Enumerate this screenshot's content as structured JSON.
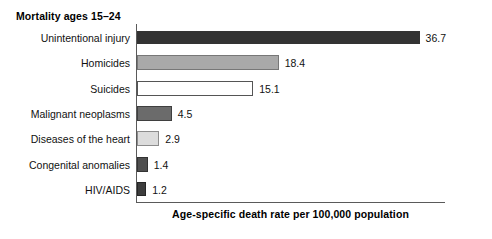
{
  "chart_data": {
    "type": "bar",
    "orientation": "horizontal",
    "title": "Mortality ages 15–24",
    "xlabel": "Age-specific death rate per 100,000 population",
    "ylabel": "",
    "categories": [
      "Unintentional injury",
      "Homicides",
      "Suicides",
      "Malignant neoplasms",
      "Diseases of the heart",
      "Congenital anomalies",
      "HIV/AIDS"
    ],
    "values": [
      36.7,
      18.4,
      15.1,
      4.5,
      2.9,
      1.4,
      1.2
    ],
    "value_labels": [
      "36.7",
      "18.4",
      "15.1",
      "4.5",
      "2.9",
      "1.4",
      "1.2"
    ],
    "bar_colors": [
      "#333333",
      "#a9a9a9",
      "#ffffff",
      "#6b6b6b",
      "#dcdcdc",
      "#4f4f4f",
      "#3d3d3d"
    ],
    "bar_borders": [
      "#333333",
      "#777777",
      "#555555",
      "#3f3f3f",
      "#8c8c8c",
      "#333333",
      "#262626"
    ],
    "xlim": [
      0,
      40
    ],
    "grid": false,
    "legend": null,
    "axis_color": "#5a5a5a"
  },
  "chart": {
    "title": "Mortality ages 15–24",
    "axis_caption": "Age-specific death rate per 100,000 population",
    "rows": [
      {
        "label": "Unintentional injury",
        "value": "36.7"
      },
      {
        "label": "Homicides",
        "value": "18.4"
      },
      {
        "label": "Suicides",
        "value": "15.1"
      },
      {
        "label": "Malignant neoplasms",
        "value": "4.5"
      },
      {
        "label": "Diseases of the heart",
        "value": "2.9"
      },
      {
        "label": "Congenital anomalies",
        "value": "1.4"
      },
      {
        "label": "HIV/AIDS",
        "value": "1.2"
      }
    ]
  }
}
